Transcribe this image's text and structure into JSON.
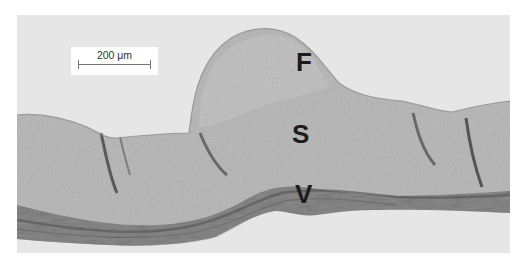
{
  "figure": {
    "type": "histology micrograph",
    "background_color": "#e4e4e4",
    "tissue_color": "#b9b9b9",
    "dense_layer_color": "#6b6b6b"
  },
  "scale_bar": {
    "label": "200 μm"
  },
  "labels": [
    {
      "id": "F",
      "text": "F"
    },
    {
      "id": "S",
      "text": "S"
    },
    {
      "id": "V",
      "text": "V"
    }
  ]
}
